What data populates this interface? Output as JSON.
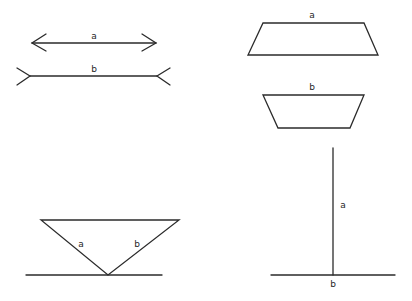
{
  "figure": {
    "panels": [
      {
        "id": "muller-lyer",
        "name": "Müller-Lyer illusion",
        "labels": {
          "a": "a",
          "b": "b"
        }
      },
      {
        "id": "jastrow-trapezoid",
        "name": "Trapezoid (Jastrow-type) illusion",
        "labels": {
          "a": "a",
          "b": "b"
        }
      },
      {
        "id": "inverted-triangle",
        "name": "Inverted triangle on baseline",
        "labels": {
          "a": "a",
          "b": "b"
        }
      },
      {
        "id": "vertical-horizontal",
        "name": "Vertical-horizontal (inverted T) illusion",
        "labels": {
          "a": "a",
          "b": "b"
        }
      }
    ]
  },
  "colors": {
    "stroke": "#2b2b2b",
    "background": "#ffffff"
  }
}
